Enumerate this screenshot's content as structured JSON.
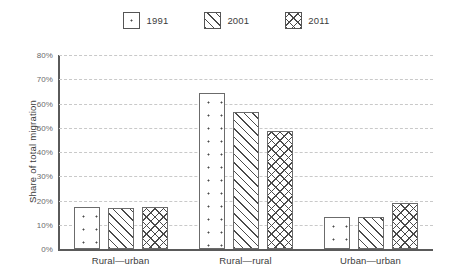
{
  "chart_data": {
    "type": "bar",
    "title": "",
    "subtitle": "",
    "xlabel": "",
    "ylabel": "Share of total migration",
    "categories": [
      "Rural—urban",
      "Rural—rural",
      "Urban—urban"
    ],
    "series": [
      {
        "name": "1991",
        "pattern": "dotted",
        "values": [
          17.5,
          64.5,
          13.0
        ]
      },
      {
        "name": "2001",
        "pattern": "diagonal",
        "values": [
          17.0,
          56.5,
          13.0
        ]
      },
      {
        "name": "2011",
        "pattern": "crosshatch",
        "values": [
          17.5,
          48.5,
          19.0
        ]
      }
    ],
    "ylim": [
      0,
      80
    ],
    "ytick_labels": [
      "0%",
      "10%",
      "20%",
      "30%",
      "40%",
      "50%",
      "60%",
      "70%",
      "80%"
    ],
    "ytick_values": [
      0,
      10,
      20,
      30,
      40,
      50,
      60,
      70,
      80
    ],
    "grid": true,
    "grid_style": "dashed-horizontal",
    "legend_position": "top-center",
    "legend_entries": [
      "1991",
      "2001",
      "2011"
    ],
    "colors": {
      "axis": "#5a5a5a",
      "grid": "#c9c9c9",
      "bar_outline": "#6b6b6b",
      "bar_fill": "#ffffff",
      "pattern": "#4a4a4a",
      "text": "#3b3b3b",
      "tick_text": "#6a6a6a",
      "background": "#ffffff"
    }
  }
}
